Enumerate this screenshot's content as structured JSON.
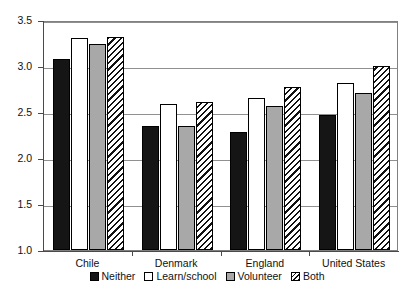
{
  "chart_data": {
    "type": "bar",
    "title": "",
    "subtitle": "",
    "xlabel": "",
    "ylabel": "",
    "ylim": [
      1.0,
      3.5
    ],
    "yticks": [
      1.0,
      1.5,
      2.0,
      2.5,
      3.0,
      3.5
    ],
    "ytick_labels": [
      "1.0",
      "1.5",
      "2.0",
      "2.5",
      "3.0",
      "3.5"
    ],
    "grid": true,
    "legend_position": "bottom",
    "categories": [
      "Chile",
      "Denmark",
      "England",
      "United States"
    ],
    "series": [
      {
        "name": "Neither",
        "style": "black",
        "values": [
          3.08,
          2.35,
          2.28,
          2.47
        ]
      },
      {
        "name": "Learn/school",
        "style": "white",
        "values": [
          3.3,
          2.59,
          2.65,
          2.81
        ]
      },
      {
        "name": "Volunteer",
        "style": "gray",
        "values": [
          3.24,
          2.35,
          2.57,
          2.71
        ]
      },
      {
        "name": "Both",
        "style": "hatch",
        "values": [
          3.32,
          2.61,
          2.77,
          3.0
        ]
      }
    ]
  },
  "legend": {
    "items": [
      {
        "label": "Neither"
      },
      {
        "label": "Learn/school"
      },
      {
        "label": "Volunteer"
      },
      {
        "label": "Both"
      }
    ]
  },
  "colors": {
    "neither": "#151515",
    "learn_school": "#ffffff",
    "volunteer": "#a8a8a8",
    "both_hatch": "#111111",
    "grid": "#909090",
    "axis": "#4a4a4a",
    "text": "#111111"
  }
}
